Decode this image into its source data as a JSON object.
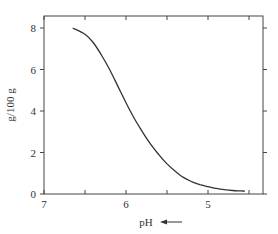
{
  "chart_data": {
    "type": "line",
    "title": "",
    "xlabel": "pH",
    "xlabel_arrow": "←",
    "ylabel": "g/100 g",
    "xlim": [
      7,
      4.4
    ],
    "ylim": [
      0,
      8.5
    ],
    "x_reversed": true,
    "grid": false,
    "legend": null,
    "x_ticks": [
      7,
      6.5,
      6,
      5.5,
      5,
      4.5
    ],
    "x_tick_labels": [
      "7",
      "",
      "6",
      "",
      "5",
      ""
    ],
    "y_ticks": [
      0,
      2,
      4,
      6,
      8
    ],
    "y_tick_labels": [
      "0",
      "2",
      "4",
      "6",
      "8"
    ],
    "series": [
      {
        "name": "solubility",
        "color": "#333333",
        "x": [
          6.65,
          6.5,
          6.4,
          6.3,
          6.2,
          6.1,
          6.0,
          5.9,
          5.8,
          5.7,
          5.6,
          5.5,
          5.4,
          5.3,
          5.2,
          5.1,
          5.0,
          4.9,
          4.8,
          4.7,
          4.6,
          4.55
        ],
        "y": [
          8.0,
          7.7,
          7.3,
          6.7,
          6.0,
          5.2,
          4.4,
          3.65,
          3.0,
          2.4,
          1.9,
          1.45,
          1.1,
          0.8,
          0.6,
          0.45,
          0.35,
          0.27,
          0.21,
          0.17,
          0.15,
          0.14
        ]
      }
    ]
  }
}
